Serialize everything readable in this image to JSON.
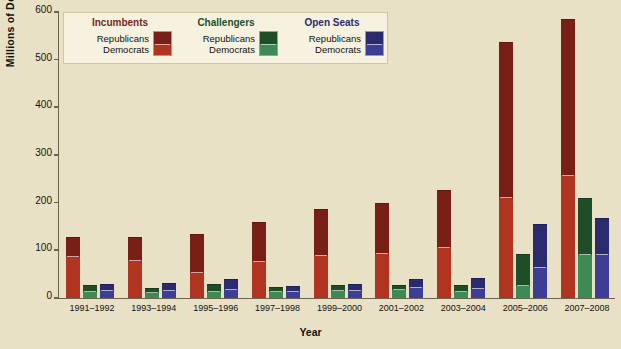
{
  "chart_data": {
    "type": "bar",
    "title": "",
    "xlabel": "Year",
    "ylabel": "Millions of Dollars",
    "ylim": [
      0,
      600
    ],
    "yticks": [
      0,
      100,
      200,
      300,
      400,
      500,
      600
    ],
    "grid": false,
    "legend_position": "top-left",
    "stacked": true,
    "categories": [
      "1991–1992",
      "1993–1994",
      "1995–1996",
      "1997–1998",
      "1999–2000",
      "2001–2002",
      "2003–2004",
      "2005–2006",
      "2007–2008"
    ],
    "series": [
      {
        "name": "Incumbents – Democrats",
        "group": "Incumbents",
        "party": "Democrats",
        "color": "#b0341f",
        "values": [
          85,
          78,
          52,
          75,
          88,
          92,
          105,
          210,
          257
        ]
      },
      {
        "name": "Incumbents – Republicans",
        "group": "Incumbents",
        "party": "Republicans",
        "color": "#7a1f16",
        "values": [
          43,
          50,
          83,
          85,
          98,
          108,
          122,
          327,
          328
        ]
      },
      {
        "name": "Challengers – Democrats",
        "group": "Challengers",
        "party": "Democrats",
        "color": "#3d8a54",
        "values": [
          12,
          11,
          13,
          12,
          14,
          16,
          13,
          25,
          90
        ]
      },
      {
        "name": "Challengers – Republicans",
        "group": "Challengers",
        "party": "Republicans",
        "color": "#1e4d28",
        "values": [
          16,
          10,
          17,
          11,
          14,
          11,
          14,
          67,
          120
        ]
      },
      {
        "name": "Open Seats – Democrats",
        "group": "Open Seats",
        "party": "Democrats",
        "color": "#3d3d96",
        "values": [
          14,
          14,
          17,
          12,
          14,
          20,
          18,
          62,
          90
        ]
      },
      {
        "name": "Open Seats – Republicans",
        "group": "Open Seats",
        "party": "Republicans",
        "color": "#2a2a6e",
        "values": [
          16,
          17,
          23,
          13,
          16,
          20,
          24,
          93,
          77
        ]
      }
    ],
    "totals": {
      "incumbents": [
        128,
        128,
        135,
        160,
        186,
        200,
        227,
        537,
        585
      ],
      "challengers": [
        28,
        21,
        30,
        23,
        28,
        27,
        27,
        92,
        210
      ],
      "open_seats": [
        30,
        31,
        40,
        25,
        30,
        40,
        42,
        155,
        167
      ]
    }
  },
  "legend": {
    "columns": [
      {
        "heading": "Incumbents",
        "heading_color": "#7a1f16",
        "rows": [
          "Republicans",
          "Democrats"
        ],
        "swatch_top": "#7a1f16",
        "swatch_bottom": "#b0341f"
      },
      {
        "heading": "Challengers",
        "heading_color": "#1e4d28",
        "rows": [
          "Republicans",
          "Democrats"
        ],
        "swatch_top": "#1e4d28",
        "swatch_bottom": "#3d8a54"
      },
      {
        "heading": "Open Seats",
        "heading_color": "#2a2a6e",
        "rows": [
          "Republicans",
          "Democrats"
        ],
        "swatch_top": "#2a2a6e",
        "swatch_bottom": "#3d3d96"
      }
    ]
  },
  "colors": {
    "background": "#e9e1c6",
    "legend_background": "#f7f2e0",
    "axis": "#6b6350",
    "text": "#14110c"
  }
}
